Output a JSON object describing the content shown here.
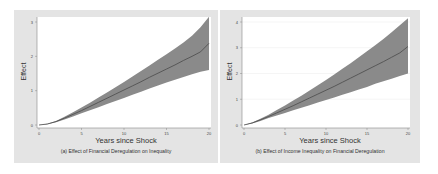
{
  "chart_data": [
    {
      "type": "line",
      "panel": "a",
      "title": "(a) Effect of Financial Deregulation on Inequality",
      "xlabel": "Years since Shock",
      "ylabel": "Effect",
      "xlim": [
        0,
        20
      ],
      "ylim": [
        0,
        3
      ],
      "xticks": [
        0,
        5,
        10,
        15,
        20
      ],
      "yticks": [
        0,
        1,
        2,
        3
      ],
      "grid": false,
      "x": [
        0,
        1,
        2,
        3,
        4,
        5,
        6,
        7,
        8,
        9,
        10,
        11,
        12,
        13,
        14,
        15,
        16,
        17,
        18,
        19,
        20
      ],
      "series": [
        {
          "name": "Effect",
          "values": [
            0,
            0.03,
            0.1,
            0.2,
            0.31,
            0.42,
            0.54,
            0.66,
            0.78,
            0.9,
            1.02,
            1.14,
            1.26,
            1.39,
            1.51,
            1.63,
            1.75,
            1.88,
            2.0,
            2.13,
            2.38
          ]
        },
        {
          "name": "Upper CI",
          "values": [
            0,
            0.04,
            0.12,
            0.24,
            0.37,
            0.51,
            0.65,
            0.8,
            0.95,
            1.1,
            1.25,
            1.41,
            1.57,
            1.73,
            1.9,
            2.06,
            2.23,
            2.4,
            2.6,
            2.85,
            3.15
          ]
        },
        {
          "name": "Lower CI",
          "values": [
            0,
            0.02,
            0.08,
            0.16,
            0.25,
            0.34,
            0.43,
            0.52,
            0.61,
            0.7,
            0.79,
            0.88,
            0.97,
            1.06,
            1.15,
            1.24,
            1.32,
            1.4,
            1.48,
            1.55,
            1.6
          ]
        }
      ]
    },
    {
      "type": "line",
      "panel": "b",
      "title": "(b) Effect of Income Inequality on Financial Deregulation",
      "xlabel": "Years since Shock",
      "ylabel": "Effect",
      "xlim": [
        0,
        20
      ],
      "ylim": [
        0,
        4
      ],
      "xticks": [
        0,
        5,
        10,
        15,
        20
      ],
      "yticks": [
        0,
        1,
        2,
        3,
        4
      ],
      "grid": true,
      "x": [
        0,
        1,
        2,
        3,
        4,
        5,
        6,
        7,
        8,
        9,
        10,
        11,
        12,
        13,
        14,
        15,
        16,
        17,
        18,
        19,
        20
      ],
      "series": [
        {
          "name": "Effect",
          "values": [
            0,
            0.08,
            0.2,
            0.33,
            0.47,
            0.61,
            0.75,
            0.9,
            1.05,
            1.2,
            1.35,
            1.5,
            1.66,
            1.82,
            1.98,
            2.14,
            2.3,
            2.46,
            2.63,
            2.8,
            3.05
          ]
        },
        {
          "name": "Upper CI",
          "values": [
            0,
            0.1,
            0.24,
            0.4,
            0.58,
            0.76,
            0.95,
            1.14,
            1.34,
            1.54,
            1.75,
            1.96,
            2.18,
            2.4,
            2.63,
            2.86,
            3.1,
            3.34,
            3.6,
            3.87,
            4.15
          ]
        },
        {
          "name": "Lower CI",
          "values": [
            0,
            0.06,
            0.16,
            0.27,
            0.37,
            0.47,
            0.57,
            0.67,
            0.77,
            0.87,
            0.97,
            1.07,
            1.17,
            1.27,
            1.38,
            1.48,
            1.6,
            1.7,
            1.8,
            1.9,
            2.0
          ]
        }
      ]
    }
  ],
  "panels": {
    "a": {
      "caption": "(a) Effect of Financial Deregulation on Inequality",
      "xlabel": "Years since Shock",
      "ylabel": "Effect"
    },
    "b": {
      "caption": "(b) Effect of Income Inequality on Financial Deregulation",
      "xlabel": "Years since Shock",
      "ylabel": "Effect"
    }
  },
  "colors": {
    "panel_bg": "#e4e4e4",
    "plot_bg": "#ffffff",
    "band": "#8a8a8a",
    "line": "#4a4a4a",
    "grid": "#eeeeee",
    "axis": "#888888"
  }
}
